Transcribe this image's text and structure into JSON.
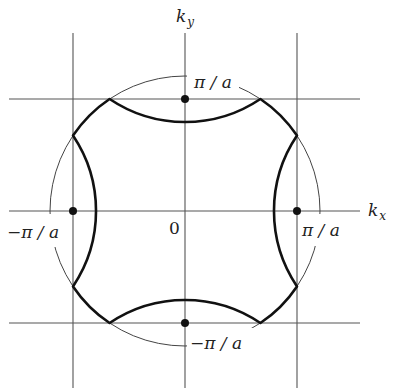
{
  "diagram": {
    "axes": {
      "x_label": "k",
      "x_sub": "x",
      "y_label": "k",
      "y_sub": "y",
      "origin_label": "0"
    },
    "boundary_labels": {
      "top": "π / a",
      "bottom": "−π / a",
      "left": "−π / a",
      "right": "π / a"
    },
    "colors": {
      "line": "#444444",
      "thick_curve": "#111111",
      "dot": "#111111",
      "background": "#ffffff"
    }
  }
}
